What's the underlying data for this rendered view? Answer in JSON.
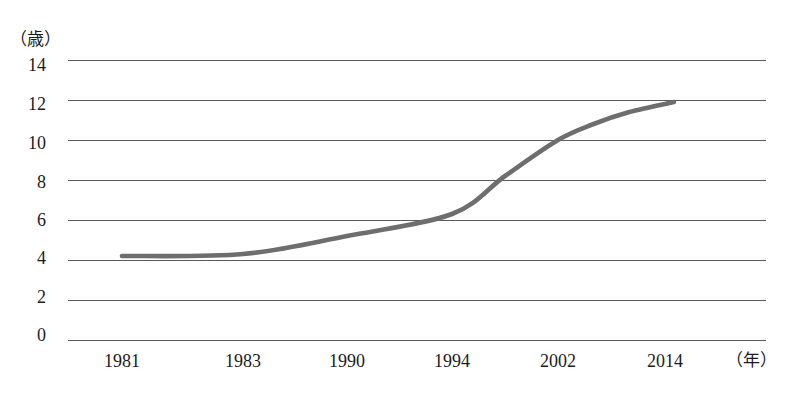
{
  "chart_data": {
    "type": "line",
    "title": "",
    "subtitle": "",
    "xlabel": "（年）",
    "ylabel": "（歳）",
    "x_tick_labels": [
      "1981",
      "1983",
      "1990",
      "1994",
      "2002",
      "2014"
    ],
    "y_tick_labels": [
      "14",
      "12",
      "10",
      "8",
      "6",
      "4",
      "2",
      "0"
    ],
    "ylim": [
      0,
      14
    ],
    "y_tick_values": [
      14,
      12,
      10,
      8,
      6,
      4,
      2,
      0
    ],
    "grid": "horizontal",
    "legend": "none",
    "series": [
      {
        "name": "年齢",
        "color": "#6e6e6e",
        "x": [
          1981,
          1983,
          1990,
          1994,
          1998,
          2002,
          2006,
          2010,
          2015
        ],
        "values": [
          4.2,
          4.3,
          5.2,
          6.3,
          8.2,
          10.0,
          10.8,
          11.4,
          11.9
        ]
      }
    ],
    "annotations": []
  },
  "axis": {
    "y_unit": "（歳）",
    "x_unit": "（年）"
  }
}
